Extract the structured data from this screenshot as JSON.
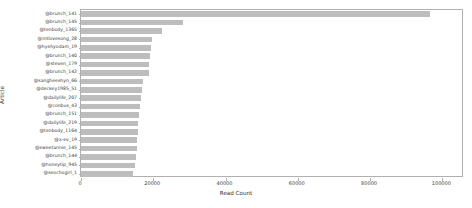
{
  "chart_data": {
    "type": "bar",
    "orientation": "horizontal",
    "title": "",
    "xlabel": "Read Count",
    "ylabel": "Article",
    "grid": false,
    "legend": null,
    "xlim": [
      0,
      106000
    ],
    "xticks": [
      0,
      20000,
      40000,
      60000,
      80000,
      100000
    ],
    "xtick_labels": [
      "0",
      "20000",
      "40000",
      "60000",
      "80000",
      "100000"
    ],
    "bar_color": "#bdbdbd",
    "categories": [
      "@brunch_141",
      "@brunch_145",
      "@tenbody_1365",
      "@intlovesong_28",
      "@hyehyodam_19",
      "@brunch_140",
      "@steven_179",
      "@brunch_142",
      "@sangheeshyn_66",
      "@deckey1985_51",
      "@dailylife_207",
      "@conbus_43",
      "@brunch_151",
      "@dailylife_219",
      "@tenbody_1164",
      "@x-ev_19",
      "@sweetannie_145",
      "@brunch_144",
      "@honeytip_945",
      "@seochogirl_1"
    ],
    "values": [
      96500,
      28100,
      22500,
      19600,
      19300,
      19100,
      18900,
      18800,
      17100,
      16900,
      16700,
      16200,
      16000,
      15900,
      15700,
      15500,
      15400,
      15200,
      15000,
      14400
    ]
  }
}
